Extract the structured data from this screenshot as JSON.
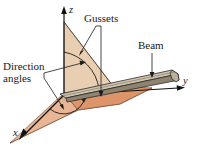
{
  "figure": {
    "background_color": "#ffffff"
  },
  "axes": {
    "z_label": "z",
    "y_label": "y",
    "x_label": "x",
    "axis_color": "#111111",
    "origin_label": ""
  },
  "annotations": {
    "gussets": {
      "label": "Gussets",
      "leader_count": 2
    },
    "beam": {
      "label": "Beam",
      "leader_count": 1
    },
    "direction_angles": {
      "label_line1": "Direction",
      "label_line2": "angles",
      "leader_count": 2
    }
  },
  "geometry": {
    "vertical_gusset_color": "#e8cdb0",
    "vertical_gusset_edge": "#6b5442",
    "horizontal_gusset_color": "#e09a72",
    "horizontal_gusset_edge": "#6b4530",
    "beam_top_color": "#cfc4b0",
    "beam_side_color": "#9a8f7c",
    "beam_end_color": "#bdb19c",
    "beam_edge": "#2b2b2b",
    "shadow_color": "#b9a48d"
  }
}
